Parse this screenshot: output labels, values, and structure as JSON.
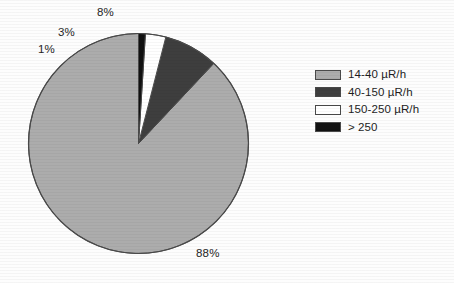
{
  "chart_data": {
    "type": "pie",
    "title": "",
    "subtitle": "",
    "xlabel": "",
    "ylabel": "",
    "grid": false,
    "legend_position": "right",
    "start_angle_deg": 90,
    "direction": "counterclockwise",
    "categories": [
      "14-40 µR/h",
      "40-150 µR/h",
      "150-250 µR/h",
      "> 250"
    ],
    "values": [
      88,
      8,
      3,
      1
    ],
    "value_unit": "%",
    "data_labels": [
      "88%",
      "8%",
      "3%",
      "1%"
    ],
    "colors": [
      "#acacac",
      "#3e3e3e",
      "#ffffff",
      "#111111"
    ],
    "slices": [
      {
        "label": "14-40 µR/h",
        "value": 88,
        "data_label": "88%",
        "color": "#acacac"
      },
      {
        "label": "40-150 µR/h",
        "value": 8,
        "data_label": "8%",
        "color": "#3e3e3e"
      },
      {
        "label": "150-250 µR/h",
        "value": 3,
        "data_label": "3%",
        "color": "#ffffff"
      },
      {
        "label": "> 250",
        "value": 1,
        "data_label": "1%",
        "color": "#111111"
      }
    ]
  },
  "legend": {
    "items": [
      {
        "label": "14-40 µR/h",
        "color": "#acacac"
      },
      {
        "label": "40-150 µR/h",
        "color": "#3e3e3e"
      },
      {
        "label": "150-250 µR/h",
        "color": "#ffffff"
      },
      {
        "label": "> 250",
        "color": "#111111"
      }
    ]
  },
  "figure": {
    "background": "#fdfdfd",
    "outline_color": "#4a4a4a"
  }
}
